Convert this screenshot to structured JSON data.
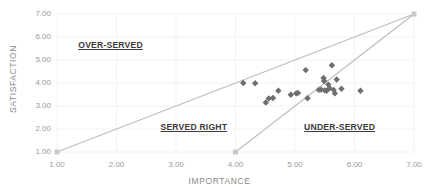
{
  "chart_data": {
    "type": "scatter",
    "title": "",
    "xlabel": "IMPORTANCE",
    "ylabel": "SATISFACTION",
    "xlim": [
      1.0,
      7.0
    ],
    "ylim": [
      1.0,
      7.0
    ],
    "xticks": [
      "1.00",
      "2.00",
      "3.00",
      "4.00",
      "5.00",
      "6.00",
      "7.00"
    ],
    "xtick_values": [
      1.0,
      2.0,
      3.0,
      4.0,
      5.0,
      6.0,
      7.0
    ],
    "yticks": [
      "1.00",
      "2.00",
      "3.00",
      "4.00",
      "5.00",
      "6.00",
      "7.00"
    ],
    "ytick_values": [
      1.0,
      2.0,
      3.0,
      4.0,
      5.0,
      6.0,
      7.0
    ],
    "grid": true,
    "legend": "none",
    "marker": "diamond",
    "marker_color": "#6e6e6e",
    "reference_line_color": "#bdbdbd",
    "points": [
      {
        "x": 4.13,
        "y": 4.0
      },
      {
        "x": 4.33,
        "y": 3.99
      },
      {
        "x": 4.51,
        "y": 3.15
      },
      {
        "x": 4.56,
        "y": 3.33
      },
      {
        "x": 4.63,
        "y": 3.35
      },
      {
        "x": 4.72,
        "y": 3.66
      },
      {
        "x": 4.93,
        "y": 3.49
      },
      {
        "x": 5.02,
        "y": 3.55
      },
      {
        "x": 5.05,
        "y": 3.57
      },
      {
        "x": 5.18,
        "y": 4.56
      },
      {
        "x": 5.21,
        "y": 3.34
      },
      {
        "x": 5.4,
        "y": 3.7
      },
      {
        "x": 5.44,
        "y": 3.71
      },
      {
        "x": 5.48,
        "y": 4.22
      },
      {
        "x": 5.49,
        "y": 4.09
      },
      {
        "x": 5.5,
        "y": 3.68
      },
      {
        "x": 5.53,
        "y": 3.66
      },
      {
        "x": 5.56,
        "y": 3.93
      },
      {
        "x": 5.58,
        "y": 3.77
      },
      {
        "x": 5.62,
        "y": 4.77
      },
      {
        "x": 5.65,
        "y": 3.7
      },
      {
        "x": 5.67,
        "y": 3.55
      },
      {
        "x": 5.7,
        "y": 4.15
      },
      {
        "x": 5.78,
        "y": 3.75
      },
      {
        "x": 6.1,
        "y": 3.66
      }
    ],
    "reference_lines": [
      {
        "name": "upper-reference-line",
        "from": {
          "x": 1.0,
          "y": 1.0
        },
        "to": {
          "x": 7.0,
          "y": 7.0
        }
      },
      {
        "name": "lower-reference-line",
        "from": {
          "x": 4.0,
          "y": 1.0
        },
        "to": {
          "x": 7.0,
          "y": 7.0
        }
      }
    ],
    "reference_endpoints": [
      {
        "x": 1.0,
        "y": 1.0
      },
      {
        "x": 4.0,
        "y": 1.0
      },
      {
        "x": 7.0,
        "y": 7.0
      }
    ],
    "annotations": [
      {
        "text": "OVER-SERVED",
        "x": 1.9,
        "y": 5.6
      },
      {
        "text": "SERVED RIGHT",
        "x": 3.3,
        "y": 2.05
      },
      {
        "text": "UNDER-SERVED",
        "x": 5.75,
        "y": 2.05
      }
    ]
  }
}
